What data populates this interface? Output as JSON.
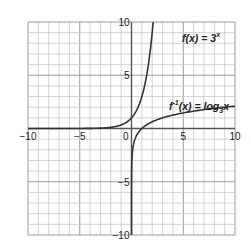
{
  "chart_data": {
    "type": "line",
    "title": "",
    "xlabel": "",
    "ylabel": "",
    "xlim": [
      -10,
      10
    ],
    "ylim": [
      -10,
      10
    ],
    "grid": true,
    "grid_step": 1,
    "x_ticks": [
      "-10",
      "-5",
      "0",
      "5",
      "10"
    ],
    "y_ticks": [
      "10",
      "5",
      "-5",
      "-10"
    ],
    "origin_label": "0",
    "series": [
      {
        "name": "f(x) = 3^x",
        "label_main": "f(x) = 3",
        "label_sup": "x",
        "function": "3^x",
        "x": [
          -10,
          -5,
          -3,
          -2,
          -1,
          0,
          1,
          2,
          2.096
        ],
        "y": [
          2e-05,
          0.004,
          0.037,
          0.111,
          0.333,
          1,
          3,
          9,
          10
        ]
      },
      {
        "name": "f^-1(x) = log_3 x",
        "label_main": "f",
        "label_sup": "-1",
        "label_mid": "(x) = log",
        "label_sub": "3",
        "label_end": "x",
        "function": "log_3(x)",
        "x": [
          2e-05,
          0.004,
          0.037,
          0.111,
          0.333,
          1,
          3,
          9,
          10
        ],
        "y": [
          -10,
          -5,
          -3,
          -2,
          -1,
          0,
          1,
          2,
          2.096
        ]
      }
    ],
    "colors": {
      "grid": "#c8c8c8",
      "axis": "#555555",
      "curve": "#333333"
    }
  }
}
